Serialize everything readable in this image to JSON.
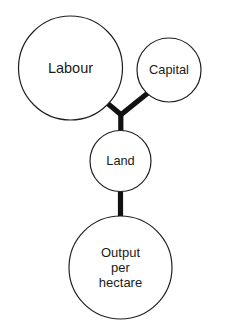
{
  "diagram": {
    "background_color": "#ffffff",
    "node_fill": "#ffffff",
    "node_stroke": "#231f20",
    "connector_color": "#111111",
    "nodes": [
      {
        "id": "labour",
        "label": "Labour",
        "cx": 70.5,
        "cy": 68,
        "r": 52
      },
      {
        "id": "capital",
        "label": "Capital",
        "cx": 169,
        "cy": 70,
        "r": 32
      },
      {
        "id": "land",
        "label": "Land",
        "cx": 120.5,
        "cy": 161,
        "r": 30.5
      },
      {
        "id": "output",
        "label": "Output per hectare",
        "label_lines": [
          "Output",
          "per",
          "hectare"
        ],
        "cx": 120.5,
        "cy": 267.5,
        "r": 51.5
      }
    ],
    "connectors": [
      {
        "id": "labour-to-land",
        "from": "labour",
        "to": "land"
      },
      {
        "id": "capital-to-land",
        "from": "capital",
        "to": "land"
      },
      {
        "id": "land-to-output",
        "from": "land",
        "to": "output"
      }
    ]
  }
}
